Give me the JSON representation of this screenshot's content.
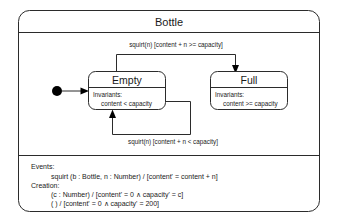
{
  "diagram": {
    "kind": "uml-statechart",
    "title": "Bottle",
    "states": [
      {
        "id": "empty",
        "name": "Empty",
        "compartment_label": "Invariants:",
        "invariant": "content < capacity"
      },
      {
        "id": "full",
        "name": "Full",
        "compartment_label": "Invariants:",
        "invariant": "content >= capacity"
      }
    ],
    "initial_state": "empty",
    "transitions": [
      {
        "id": "empty-to-full",
        "from": "empty",
        "to": "full",
        "label": "squirt(n) [content + n >= capacity]"
      },
      {
        "id": "empty-to-empty",
        "from": "empty",
        "to": "empty",
        "label": "squirt(n) [content + n < capacity]"
      },
      {
        "id": "initial-to-empty",
        "from": "initial",
        "to": "empty",
        "label": ""
      }
    ],
    "spec": {
      "events_heading": "Events:",
      "events": [
        "squirt (b : Bottle, n : Number) / [content' = content + n]"
      ],
      "creation_heading": "Creation:",
      "creations": [
        "(c : Number) / [content' = 0 ∧ capacity' = c]",
        "( ) / [content' = 0 ∧ capacity' = 200]"
      ]
    },
    "colors": {
      "stroke": "#2b2b2b",
      "text": "#1a1a1a",
      "background": "#ffffff",
      "initial_dot": "#000000"
    }
  }
}
